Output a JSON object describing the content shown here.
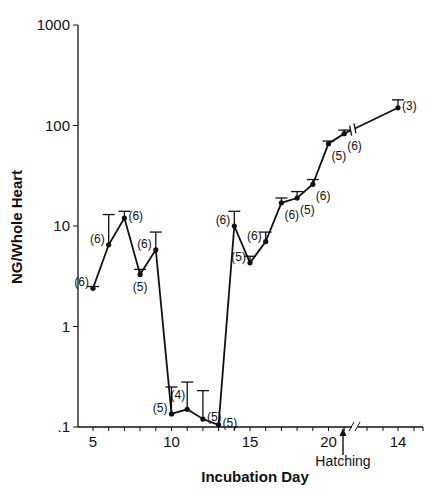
{
  "chart_data": {
    "type": "line",
    "title": "",
    "xlabel": "Incubation Day",
    "ylabel": "NG/Whole Heart",
    "yscale": "log",
    "ylim": [
      0.1,
      1000
    ],
    "y_ticks": [
      {
        "value": 0.1,
        "label": ".1"
      },
      {
        "value": 1,
        "label": "1"
      },
      {
        "value": 10,
        "label": "10"
      },
      {
        "value": 100,
        "label": "100"
      },
      {
        "value": 1000,
        "label": "1000"
      }
    ],
    "x_tick_labels": [
      {
        "label": "5",
        "pos": 5
      },
      {
        "label": "10",
        "pos": 10
      },
      {
        "label": "15",
        "pos": 15
      },
      {
        "label": "20",
        "pos": 20
      },
      {
        "label": "14",
        "pos": 23.5,
        "note": "post-hatch day"
      }
    ],
    "axis_break_after": 21,
    "annotation": {
      "text": "Hatching",
      "x": 21,
      "arrow": "up"
    },
    "grid": false,
    "series": [
      {
        "name": "NG per whole heart (mean + SE)",
        "points": [
          {
            "x": 5,
            "y": 2.4,
            "err_top": 2.5,
            "n": "(6)",
            "label_side": "left"
          },
          {
            "x": 6,
            "y": 6.5,
            "err_top": 13,
            "n": "(6)",
            "label_side": "left"
          },
          {
            "x": 7,
            "y": 12,
            "err_top": 14,
            "n": "(6)",
            "label_side": "right"
          },
          {
            "x": 8,
            "y": 3.3,
            "err_top": 3.7,
            "n": "(5)",
            "label_side": "below"
          },
          {
            "x": 9,
            "y": 5.8,
            "err_top": 8.7,
            "n": "(6)",
            "label_side": "left"
          },
          {
            "x": 10,
            "y": 0.135,
            "err_top": 0.25,
            "n": "(5)",
            "label_side": "left"
          },
          {
            "x": 11,
            "y": 0.15,
            "err_top": 0.28,
            "n": "(4)",
            "label_side": "aboveleft"
          },
          {
            "x": 12,
            "y": 0.12,
            "err_top": 0.23,
            "n": "(5)",
            "label_side": "right"
          },
          {
            "x": 13,
            "y": 0.105,
            "err_top": 0.105,
            "n": "(5)",
            "label_side": "right"
          },
          {
            "x": 14,
            "y": 10,
            "err_top": 14,
            "n": "(6)",
            "label_side": "left"
          },
          {
            "x": 15,
            "y": 4.3,
            "err_top": 5,
            "n": "(5)",
            "label_side": "left"
          },
          {
            "x": 16,
            "y": 7,
            "err_top": 8.7,
            "n": "(6)",
            "label_side": "left"
          },
          {
            "x": 17,
            "y": 17,
            "err_top": 19,
            "n": "(6)",
            "label_side": "below"
          },
          {
            "x": 18,
            "y": 19,
            "err_top": 22,
            "n": "(5)",
            "label_side": "below"
          },
          {
            "x": 19,
            "y": 26,
            "err_top": 29,
            "n": "(6)",
            "label_side": "below"
          },
          {
            "x": 20,
            "y": 66,
            "err_top": 70,
            "n": "(5)",
            "label_side": "below"
          },
          {
            "x": 21,
            "y": 83,
            "err_top": 90,
            "n": "(6)",
            "label_side": "below"
          },
          {
            "x": 24.5,
            "y": 150,
            "err_top": 180,
            "n": "(3)",
            "label_side": "right",
            "note": "post-hatch day 14"
          }
        ]
      }
    ]
  }
}
